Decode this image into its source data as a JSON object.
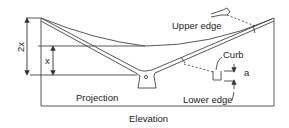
{
  "diagram": {
    "labels": {
      "upper_edge": "Upper edge",
      "lower_edge": "Lower edge",
      "curb": "Curb",
      "a": "a",
      "projection": "Projection",
      "elevation": "Elevation",
      "two_x": "2x",
      "x": "x"
    },
    "colors": {
      "line": "#333333",
      "background": "#ffffff"
    }
  }
}
